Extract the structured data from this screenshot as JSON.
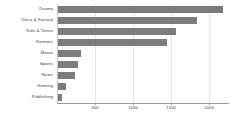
{
  "chart_data": {
    "type": "bar",
    "orientation": "horizontal",
    "title": "",
    "subtitle": "",
    "xlabel": "",
    "ylabel": "",
    "categories": [
      "Drama",
      "Docu & Factual",
      "Kids & Teens",
      "Formats",
      "Movie",
      "Sports",
      "News",
      "Gaming",
      "Publishing"
    ],
    "values": [
      2180,
      1840,
      1560,
      1440,
      310,
      270,
      240,
      120,
      60
    ],
    "xlim": [
      0,
      2260
    ],
    "xticks": [
      500,
      1000,
      1500,
      2000
    ],
    "xtick_labels": [
      "500",
      "1000",
      "1500",
      "2000"
    ],
    "grid": true,
    "grid_axis": "x",
    "legend": null,
    "bar_color": "#7c7c7c",
    "gridline_color": "#e6e6e6",
    "axis_color": "#9a9a9a",
    "background_color": "#ffffff"
  }
}
